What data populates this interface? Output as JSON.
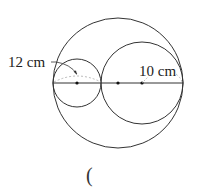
{
  "diagram": {
    "circles": [
      {
        "name": "large-circle"
      },
      {
        "name": "small-circle-left"
      },
      {
        "name": "medium-circle-right"
      }
    ],
    "labels": {
      "left_measure": "12 cm",
      "right_measure": "10 cm"
    },
    "answer_blank": "("
  }
}
